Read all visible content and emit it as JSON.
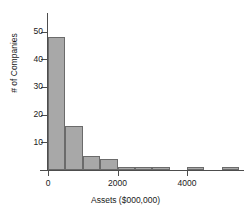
{
  "chart_data": {
    "type": "bar",
    "title": "",
    "subtitle": "",
    "xlabel": "Assets ($000,000)",
    "ylabel": "# of Companies",
    "grid": false,
    "legend": "none",
    "bin_width": 500,
    "xlim": [
      -250,
      5750
    ],
    "ylim": [
      0,
      52
    ],
    "xticks": [
      0,
      2000,
      4000
    ],
    "xtick_labels": [
      "0",
      "2000",
      "4000"
    ],
    "yticks": [
      10,
      20,
      30,
      40,
      50
    ],
    "ytick_labels": [
      "10",
      "20",
      "30",
      "40",
      "50"
    ],
    "bins": [
      {
        "left": 0,
        "right": 500,
        "count": 48
      },
      {
        "left": 500,
        "right": 1000,
        "count": 16
      },
      {
        "left": 1000,
        "right": 1500,
        "count": 5
      },
      {
        "left": 1500,
        "right": 2000,
        "count": 4
      },
      {
        "left": 2000,
        "right": 2500,
        "count": 1
      },
      {
        "left": 2500,
        "right": 3000,
        "count": 1
      },
      {
        "left": 3000,
        "right": 3500,
        "count": 1
      },
      {
        "left": 3500,
        "right": 4000,
        "count": 0
      },
      {
        "left": 4000,
        "right": 4500,
        "count": 1
      },
      {
        "left": 4500,
        "right": 5000,
        "count": 0
      },
      {
        "left": 5000,
        "right": 5500,
        "count": 1
      },
      {
        "left": 5500,
        "right": 6000,
        "count": 0
      },
      {
        "left": 6000,
        "right": 6500,
        "count": 1
      },
      {
        "left": 6500,
        "right": 7000,
        "count": 1
      }
    ],
    "categories": [
      "0-500",
      "500-1000",
      "1000-1500",
      "1500-2000",
      "2000-2500",
      "2500-3000",
      "3000-3500",
      "3500-4000",
      "4000-4500",
      "4500-5000",
      "5000-5500",
      "5500-6000",
      "6000-6500",
      "6500-7000"
    ],
    "values": [
      48,
      16,
      5,
      4,
      1,
      1,
      1,
      0,
      1,
      0,
      1,
      0,
      1,
      1
    ],
    "colors": {
      "bar_fill": "#a8a8a8",
      "bar_edge": "#6b6b6b",
      "axis": "#4d4d4d",
      "text": "#1a1a1a",
      "background": "#ffffff"
    }
  }
}
